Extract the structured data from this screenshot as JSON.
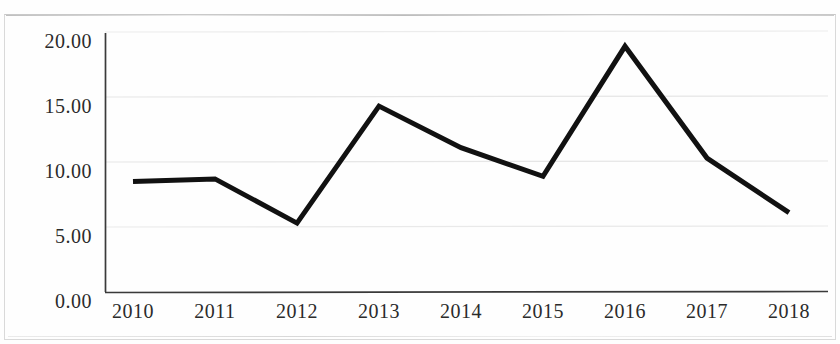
{
  "chart_data": {
    "type": "line",
    "title": "",
    "subtitle": "",
    "xlabel": "",
    "ylabel": "",
    "categories": [
      "2010",
      "2011",
      "2012",
      "2013",
      "2014",
      "2015",
      "2016",
      "2017",
      "2018"
    ],
    "values": [
      8.5,
      8.7,
      5.3,
      14.3,
      11.1,
      8.9,
      18.9,
      10.3,
      6.1
    ],
    "series": [
      {
        "name": "",
        "values": [
          8.5,
          8.7,
          5.3,
          14.3,
          11.1,
          8.9,
          18.9,
          10.3,
          6.1
        ]
      }
    ],
    "ylim": [
      0,
      20
    ],
    "xlim": [
      "2010",
      "2018"
    ],
    "y_ticks": [
      0,
      5,
      10,
      15,
      20
    ],
    "y_tick_labels": [
      "0.00",
      "5.00",
      "10.00",
      "15.00",
      "20.00"
    ],
    "x_tick_labels": [
      "2010",
      "2011",
      "2012",
      "2013",
      "2014",
      "2015",
      "2016",
      "2017",
      "2018"
    ],
    "grid": "horizontal",
    "legend": "none",
    "line_color": "#111111",
    "line_width": 5,
    "markers": "none",
    "axis_color": "#3a3a3a",
    "grid_color": "#e8e8e8",
    "background_color": "#fefefe",
    "annotations": []
  },
  "axes": {
    "y_labels": [
      "20.00",
      "15.00",
      "10.00",
      "5.00",
      "0.00"
    ],
    "x_labels": [
      "2010",
      "2011",
      "2012",
      "2013",
      "2014",
      "2015",
      "2016",
      "2017",
      "2018"
    ]
  }
}
